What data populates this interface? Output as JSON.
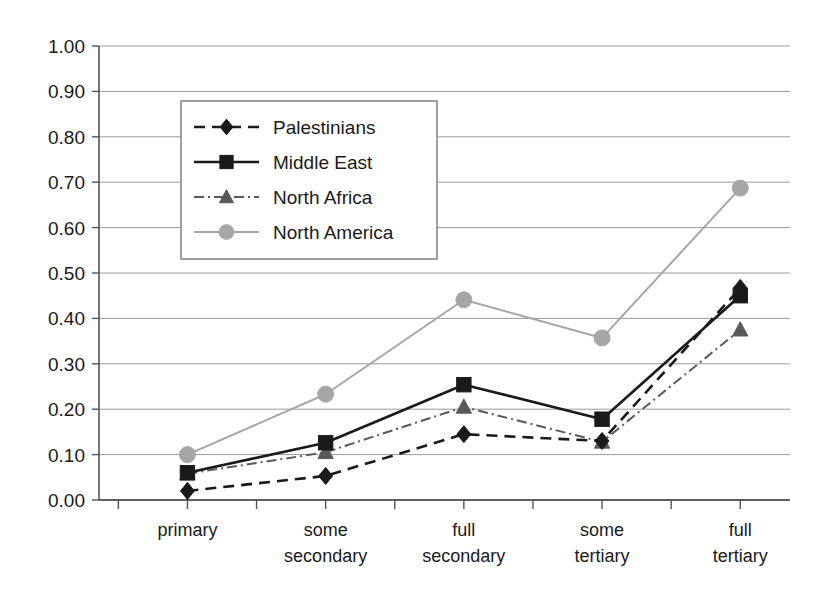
{
  "chart_data": {
    "type": "line",
    "title": "",
    "xlabel": "",
    "ylabel": "",
    "categories": [
      "primary",
      "some secondary",
      "full secondary",
      "some tertiary",
      "full tertiary"
    ],
    "category_lines": [
      [
        "primary"
      ],
      [
        "some",
        "secondary"
      ],
      [
        "full",
        "secondary"
      ],
      [
        "some",
        "tertiary"
      ],
      [
        "full",
        "tertiary"
      ]
    ],
    "ylim": [
      0.0,
      1.0
    ],
    "ytick_labels": [
      "0.00",
      "0.10",
      "0.20",
      "0.30",
      "0.40",
      "0.50",
      "0.60",
      "0.70",
      "0.80",
      "0.90",
      "1.00"
    ],
    "ytick_values": [
      0.0,
      0.1,
      0.2,
      0.3,
      0.4,
      0.5,
      0.6,
      0.7,
      0.8,
      0.9,
      1.0
    ],
    "grid": true,
    "legend_position": "upper-left-inside",
    "series": [
      {
        "name": "Palestinians",
        "values": [
          0.02,
          0.053,
          0.145,
          0.13,
          0.467
        ],
        "color": "#1a1a1a",
        "marker": "diamond",
        "linestyle": "dashed",
        "dasharray": "11,7",
        "width": 2.6
      },
      {
        "name": "Middle East",
        "values": [
          0.06,
          0.126,
          0.254,
          0.178,
          0.45
        ],
        "color": "#1a1a1a",
        "marker": "square",
        "linestyle": "solid",
        "dasharray": "none",
        "width": 2.6
      },
      {
        "name": "North Africa",
        "values": [
          0.058,
          0.105,
          0.205,
          0.128,
          0.375
        ],
        "color": "#595959",
        "marker": "triangle",
        "linestyle": "dashdot",
        "dasharray": "10,4,2,4",
        "width": 2.0
      },
      {
        "name": "North America",
        "values": [
          0.1,
          0.233,
          0.441,
          0.357,
          0.687
        ],
        "color": "#a6a6a6",
        "marker": "circle",
        "linestyle": "solid",
        "dasharray": "none",
        "width": 2.0
      }
    ]
  },
  "legend": {
    "entries": [
      "Palestinians",
      "Middle East",
      "North Africa",
      "North America"
    ]
  }
}
